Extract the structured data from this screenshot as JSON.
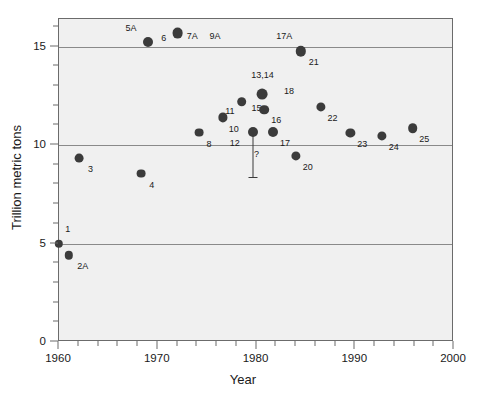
{
  "chart_data": {
    "type": "scatter",
    "title": "",
    "xlabel": "Year",
    "ylabel": "Trillion metric tons",
    "xlim": [
      1960,
      2000
    ],
    "ylim": [
      0,
      16.4
    ],
    "grid": true,
    "gridlines_y": [
      5,
      10,
      15
    ],
    "legend": "none",
    "xticks_major": [
      1960,
      1970,
      1980,
      1990,
      2000
    ],
    "xticks_major_labels": [
      "1960",
      "1970",
      "1980",
      "1990",
      "2000"
    ],
    "xticks_minor": [
      1962,
      1964,
      1966,
      1968,
      1972,
      1974,
      1976,
      1978,
      1982,
      1984,
      1986,
      1988,
      1992,
      1994,
      1996,
      1998
    ],
    "yticks_major": [
      0,
      5,
      10,
      15
    ],
    "yticks_major_labels": [
      "0",
      "5",
      "10",
      "15"
    ],
    "yticks_minor": [
      1,
      2,
      3,
      4,
      6,
      7,
      8,
      9,
      11,
      12,
      13,
      14,
      16
    ],
    "marker_color": "#3b3b3b",
    "plot_background": "#f0f0f0",
    "points": [
      {
        "label": "1",
        "x": 1960.0,
        "y": 5.0,
        "r": 4.2,
        "lx": 1960.9,
        "ly": 5.75,
        "show_marker": true
      },
      {
        "label": "2A",
        "x": 1961.0,
        "y": 4.4,
        "r": 4.2,
        "lx": 1962.4,
        "ly": 3.85,
        "show_marker": true
      },
      {
        "label": "3",
        "x": 1962.0,
        "y": 9.35,
        "r": 4.4,
        "lx": 1963.2,
        "ly": 8.8,
        "show_marker": true
      },
      {
        "label": "4",
        "x": 1968.3,
        "y": 8.55,
        "r": 4.4,
        "lx": 1969.4,
        "ly": 7.95,
        "show_marker": true
      },
      {
        "label": "5A",
        "x": 1969.0,
        "y": 15.25,
        "r": 5.0,
        "lx": 1967.3,
        "ly": 15.95,
        "show_marker": true
      },
      {
        "label": "6",
        "x": 1972.0,
        "y": 15.7,
        "r": 5.4,
        "lx": 1970.6,
        "ly": 15.45,
        "show_marker": true
      },
      {
        "label": "7A",
        "x": null,
        "y": null,
        "r": 0,
        "lx": 1973.5,
        "ly": 15.55,
        "show_marker": false
      },
      {
        "label": "9A",
        "x": null,
        "y": null,
        "r": 0,
        "lx": 1975.8,
        "ly": 15.55,
        "show_marker": false
      },
      {
        "label": "8",
        "x": 1974.2,
        "y": 10.63,
        "r": 4.4,
        "lx": 1975.2,
        "ly": 10.05,
        "show_marker": true
      },
      {
        "label": "10",
        "x": 1976.6,
        "y": 11.4,
        "r": 4.6,
        "lx": 1977.7,
        "ly": 10.8,
        "show_marker": true
      },
      {
        "label": "11",
        "x": 1978.5,
        "y": 12.2,
        "r": 4.8,
        "lx": 1977.3,
        "ly": 11.75,
        "show_marker": true
      },
      {
        "label": "12",
        "x": 1979.6,
        "y": 10.65,
        "r": 5.0,
        "lx": 1977.8,
        "ly": 10.1,
        "show_marker": true
      },
      {
        "label": "13,14",
        "x": 1980.6,
        "y": 12.6,
        "r": 5.4,
        "lx": 1980.6,
        "ly": 13.55,
        "show_marker": true
      },
      {
        "label": "15",
        "x": 1978.5,
        "y": 12.2,
        "r": 0,
        "lx": 1980.0,
        "ly": 11.9,
        "show_marker": false
      },
      {
        "label": "16",
        "x": 1980.8,
        "y": 11.8,
        "r": 4.8,
        "lx": 1982.0,
        "ly": 11.25,
        "show_marker": true
      },
      {
        "label": "17",
        "x": 1981.7,
        "y": 10.65,
        "r": 5.0,
        "lx": 1982.9,
        "ly": 10.1,
        "show_marker": true
      },
      {
        "label": "17A",
        "x": null,
        "y": null,
        "r": 0,
        "lx": 1982.8,
        "ly": 15.55,
        "show_marker": false
      },
      {
        "label": "18",
        "x": null,
        "y": null,
        "r": 0,
        "lx": 1983.3,
        "ly": 12.75,
        "show_marker": false
      },
      {
        "label": "20",
        "x": 1984.0,
        "y": 9.45,
        "r": 4.6,
        "lx": 1985.2,
        "ly": 8.9,
        "show_marker": true
      },
      {
        "label": "21",
        "x": 1984.5,
        "y": 14.75,
        "r": 5.2,
        "lx": 1985.8,
        "ly": 14.2,
        "show_marker": true
      },
      {
        "label": "22",
        "x": 1986.5,
        "y": 11.95,
        "r": 4.6,
        "lx": 1987.7,
        "ly": 11.35,
        "show_marker": true
      },
      {
        "label": "23",
        "x": 1989.5,
        "y": 10.6,
        "r": 4.6,
        "lx": 1990.7,
        "ly": 10.05,
        "show_marker": true
      },
      {
        "label": "24",
        "x": 1992.7,
        "y": 10.45,
        "r": 4.6,
        "lx": 1993.9,
        "ly": 9.9,
        "show_marker": true
      },
      {
        "label": "25",
        "x": 1995.8,
        "y": 10.85,
        "r": 4.8,
        "lx": 1997.0,
        "ly": 10.3,
        "show_marker": true
      }
    ],
    "error_bars": [
      {
        "label": "?",
        "x": 1979.6,
        "y_top": 10.65,
        "y_bottom": 8.4,
        "cap_width": 9,
        "lx": 1980.0,
        "ly": 9.55
      }
    ]
  }
}
